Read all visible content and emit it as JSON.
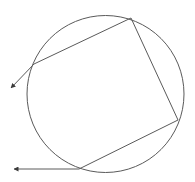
{
  "diagram": {
    "colors": {
      "background": "#ffffff",
      "stroke": "#5a5a5a"
    },
    "circle": {
      "cx": 105.5,
      "cy": 94,
      "r": 78.5
    },
    "ray_path": {
      "points": [
        {
          "x": 11,
          "y": 88
        },
        {
          "x": 34,
          "y": 64
        },
        {
          "x": 131,
          "y": 18
        },
        {
          "x": 178,
          "y": 120
        },
        {
          "x": 79,
          "y": 169
        },
        {
          "x": 14,
          "y": 169
        }
      ]
    },
    "arrowheads": [
      {
        "tip": {
          "x": 11,
          "y": 88
        },
        "from": {
          "x": 34,
          "y": 64
        }
      },
      {
        "tip": {
          "x": 14,
          "y": 169
        },
        "from": {
          "x": 79,
          "y": 169
        }
      }
    ]
  }
}
